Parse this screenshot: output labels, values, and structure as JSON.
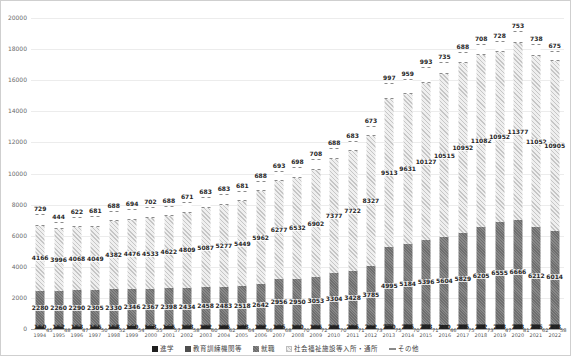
{
  "chart_data": {
    "type": "bar",
    "stacked": true,
    "title": "",
    "xlabel": "",
    "ylabel": "",
    "ylim": [
      0,
      20000
    ],
    "ytick_step": 2000,
    "grid": "horizontal",
    "legend_position": "bottom",
    "categories": [
      "1994",
      "1995",
      "1996",
      "1997",
      "1998",
      "1999",
      "2000",
      "2001",
      "2002",
      "2003",
      "2004",
      "2005",
      "2006",
      "2007",
      "2008",
      "2009",
      "2010",
      "2011",
      "2012",
      "2013",
      "2014",
      "2015",
      "2016",
      "2017",
      "2018",
      "2019",
      "2020",
      "2021",
      "2022"
    ],
    "series": [
      {
        "name": "進学",
        "color": "#1f1f1f",
        "pattern": "solid",
        "values": [
          150,
          152,
          153,
          155,
          158,
          160,
          163,
          165,
          168,
          172,
          175,
          178,
          182,
          186,
          190,
          195,
          201,
          206,
          212,
          220,
          226,
          233,
          240,
          246,
          252,
          258,
          263,
          256,
          248
        ]
      },
      {
        "name": "教育訓練機関等",
        "color": "#4d4d4d",
        "pattern": "solid",
        "values": [
          45,
          48,
          47,
          50,
          52,
          54,
          55,
          57,
          58,
          60,
          62,
          64,
          66,
          68,
          70,
          72,
          70,
          71,
          73,
          75,
          70,
          71,
          46,
          75,
          73,
          47,
          81,
          62,
          58
        ]
      },
      {
        "name": "就職",
        "color": "#7a7a7a",
        "pattern": "speckle",
        "values": [
          2280,
          2260,
          2290,
          2305,
          2330,
          2346,
          2367,
          2398,
          2434,
          2458,
          2483,
          2518,
          2642,
          2956,
          2950,
          3053,
          3304,
          3428,
          3785,
          4995,
          5184,
          5396,
          5604,
          5829,
          6205,
          6555,
          6666,
          6212,
          6014
        ]
      },
      {
        "name": "社会福祉施設等入所・通所",
        "color": "#dedede",
        "pattern": "diagonal-hatch",
        "values": [
          4166,
          3996,
          4068,
          4049,
          4382,
          4476,
          4533,
          4622,
          4809,
          5087,
          5277,
          5449,
          5962,
          6277,
          6532,
          6902,
          7377,
          7722,
          8327,
          9513,
          9631,
          10127,
          10515,
          10952,
          11082,
          10952,
          11377,
          11052,
          10905
        ]
      },
      {
        "name": "その他",
        "color": "#ffffff",
        "pattern": "dashed-outline",
        "values": [
          729,
          444,
          622,
          681,
          688,
          694,
          702,
          688,
          671,
          683,
          683,
          681,
          688,
          693,
          698,
          708,
          688,
          683,
          673,
          997,
          959,
          993,
          735,
          688,
          708,
          728,
          753,
          738,
          675
        ]
      }
    ]
  },
  "axis": {
    "y_ticks": [
      "0",
      "2000",
      "4000",
      "6000",
      "8000",
      "10000",
      "12000",
      "14000",
      "16000",
      "18000",
      "20000"
    ]
  },
  "colors": {
    "gridline": "#ececec",
    "axis_line": "#a8a8a8",
    "tick_text": "#6b6b6b",
    "label_text": "#262626"
  }
}
